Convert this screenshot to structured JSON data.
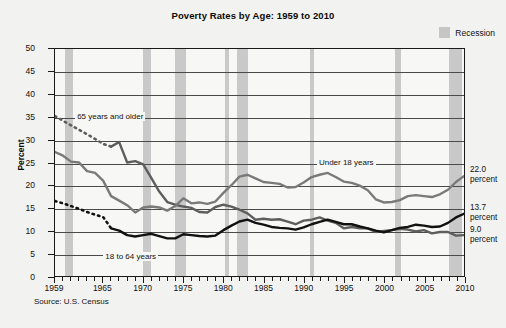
{
  "chart_data": {
    "type": "line",
    "title": "Poverty Rates by Age: 1959 to 2010",
    "xlabel": "",
    "ylabel": "Percent",
    "xlim": [
      1959,
      2010
    ],
    "ylim": [
      0,
      50
    ],
    "yticks": [
      0,
      5,
      10,
      15,
      20,
      25,
      30,
      35,
      40,
      45,
      50
    ],
    "xticks": [
      1959,
      1965,
      1970,
      1975,
      1980,
      1985,
      1990,
      1995,
      2000,
      2005,
      2010
    ],
    "grid": true,
    "legend_position": "top-right",
    "legend": [
      {
        "label": "Recession",
        "color": "#c9c9c9",
        "type": "band"
      }
    ],
    "source": "Source: U.S. Census",
    "recessions": [
      {
        "start": 1960.3,
        "end": 1961.2
      },
      {
        "start": 1969.9,
        "end": 1970.9
      },
      {
        "start": 1973.9,
        "end": 1975.2
      },
      {
        "start": 1980.1,
        "end": 1980.6
      },
      {
        "start": 1981.6,
        "end": 1982.9
      },
      {
        "start": 1990.6,
        "end": 1991.2
      },
      {
        "start": 2001.2,
        "end": 2001.9
      },
      {
        "start": 2007.9,
        "end": 2009.5
      }
    ],
    "series": [
      {
        "name": "65 years and older",
        "color": "#5e5e5e",
        "end_value": "9.0",
        "end_label": "9.0 percent",
        "dashed_until": 1966,
        "x": [
          1959,
          1960,
          1961,
          1962,
          1963,
          1964,
          1965,
          1966,
          1967,
          1968,
          1969,
          1970,
          1971,
          1972,
          1973,
          1974,
          1975,
          1976,
          1977,
          1978,
          1979,
          1980,
          1981,
          1982,
          1983,
          1984,
          1985,
          1986,
          1987,
          1988,
          1989,
          1990,
          1991,
          1992,
          1993,
          1994,
          1995,
          1996,
          1997,
          1998,
          1999,
          2000,
          2001,
          2002,
          2003,
          2004,
          2005,
          2006,
          2007,
          2008,
          2009,
          2010
        ],
        "y": [
          35.2,
          34.2,
          33.2,
          32.2,
          31.2,
          30.2,
          29.1,
          28.5,
          29.5,
          25.0,
          25.3,
          24.6,
          21.6,
          18.6,
          16.3,
          15.7,
          15.3,
          15.0,
          14.1,
          14.0,
          15.2,
          15.7,
          15.3,
          14.6,
          13.8,
          12.4,
          12.6,
          12.4,
          12.5,
          12.0,
          11.4,
          12.2,
          12.4,
          12.9,
          12.2,
          11.7,
          10.5,
          10.8,
          10.5,
          10.5,
          9.7,
          9.9,
          10.1,
          10.4,
          10.2,
          9.8,
          10.1,
          9.4,
          9.7,
          9.7,
          8.9,
          9.0
        ]
      },
      {
        "name": "Under 18 years",
        "color": "#7a7a7a",
        "end_value": "22.0",
        "end_label": "22.0 percent",
        "x": [
          1959,
          1960,
          1961,
          1962,
          1963,
          1964,
          1965,
          1966,
          1967,
          1968,
          1969,
          1970,
          1971,
          1972,
          1973,
          1974,
          1975,
          1976,
          1977,
          1978,
          1979,
          1980,
          1981,
          1982,
          1983,
          1984,
          1985,
          1986,
          1987,
          1988,
          1989,
          1990,
          1991,
          1992,
          1993,
          1994,
          1995,
          1996,
          1997,
          1998,
          1999,
          2000,
          2001,
          2002,
          2003,
          2004,
          2005,
          2006,
          2007,
          2008,
          2009,
          2010
        ],
        "y": [
          27.3,
          26.5,
          25.2,
          25.0,
          23.1,
          22.7,
          21.0,
          17.6,
          16.6,
          15.6,
          14.0,
          15.1,
          15.3,
          15.1,
          14.4,
          15.4,
          17.1,
          16.0,
          16.2,
          15.9,
          16.4,
          18.3,
          20.0,
          21.9,
          22.3,
          21.5,
          20.7,
          20.5,
          20.3,
          19.5,
          19.6,
          20.6,
          21.8,
          22.3,
          22.7,
          21.8,
          20.8,
          20.5,
          19.9,
          18.9,
          16.9,
          16.2,
          16.3,
          16.7,
          17.6,
          17.8,
          17.6,
          17.4,
          18.0,
          19.0,
          20.7,
          22.0
        ]
      },
      {
        "name": "18 to 64 years",
        "color": "#111111",
        "end_value": "13.7",
        "end_label": "13.7 percent",
        "dashed_until": 1966,
        "x": [
          1959,
          1960,
          1961,
          1962,
          1963,
          1964,
          1965,
          1966,
          1967,
          1968,
          1969,
          1970,
          1971,
          1972,
          1973,
          1974,
          1975,
          1976,
          1977,
          1978,
          1979,
          1980,
          1981,
          1982,
          1983,
          1984,
          1985,
          1986,
          1987,
          1988,
          1989,
          1990,
          1991,
          1992,
          1993,
          1994,
          1995,
          1996,
          1997,
          1998,
          1999,
          2000,
          2001,
          2002,
          2003,
          2004,
          2005,
          2006,
          2007,
          2008,
          2009,
          2010
        ],
        "y": [
          16.5,
          16.0,
          15.4,
          14.8,
          14.1,
          13.5,
          13.0,
          10.5,
          10.0,
          9.0,
          8.7,
          9.0,
          9.3,
          8.8,
          8.3,
          8.3,
          9.2,
          9.0,
          8.8,
          8.7,
          8.9,
          10.1,
          11.1,
          12.0,
          12.4,
          11.7,
          11.3,
          10.8,
          10.6,
          10.5,
          10.2,
          10.7,
          11.4,
          11.9,
          12.4,
          11.9,
          11.4,
          11.4,
          10.9,
          10.5,
          10.0,
          9.6,
          10.1,
          10.6,
          10.8,
          11.3,
          11.1,
          10.8,
          10.9,
          11.7,
          12.9,
          13.7
        ]
      }
    ],
    "annotations": [
      {
        "text": "65 years and older",
        "x": 1961.5,
        "y": 35
      },
      {
        "text": "Under 18 years",
        "x": 1991.5,
        "y": 25
      },
      {
        "text": "18 to 64 years",
        "x": 1965.0,
        "y": 4.5
      }
    ]
  }
}
